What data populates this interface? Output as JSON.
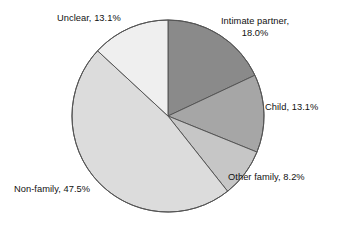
{
  "chart_data": {
    "type": "pie",
    "title": "",
    "subtitle": "",
    "xlabel": "",
    "ylabel": "",
    "legend_position": "none",
    "grid": false,
    "start_angle_deg": 90,
    "direction": "clockwise",
    "categories": [
      "Intimate partner",
      "Child",
      "Other family",
      "Non-family",
      "Unclear"
    ],
    "values": [
      18.0,
      13.1,
      8.2,
      47.5,
      13.1
    ],
    "units": "percent",
    "slices": [
      {
        "name": "Intimate partner",
        "value": 18.0,
        "value_text": "18.0%",
        "label": "Intimate partner,\n18.0%",
        "color": "#8a8a8a"
      },
      {
        "name": "Child",
        "value": 13.1,
        "value_text": "13.1%",
        "label": "Child, 13.1%",
        "color": "#a6a6a6"
      },
      {
        "name": "Other family",
        "value": 8.2,
        "value_text": "8.2%",
        "label": "Other family, 8.2%",
        "color": "#c6c6c6"
      },
      {
        "name": "Non-family",
        "value": 47.5,
        "value_text": "47.5%",
        "label": "Non-family, 47.5%",
        "color": "#dcdcdc"
      },
      {
        "name": "Unclear",
        "value": 13.1,
        "value_text": "13.1%",
        "label": "Unclear, 13.1%",
        "color": "#efefef"
      }
    ],
    "outline_color": "#555555",
    "background_color": "#ffffff"
  },
  "labels": {
    "intimate_partner": "Intimate partner,\n18.0%",
    "child": "Child, 13.1%",
    "other_family": "Other family, 8.2%",
    "non_family": "Non-family, 47.5%",
    "unclear": "Unclear, 13.1%"
  }
}
